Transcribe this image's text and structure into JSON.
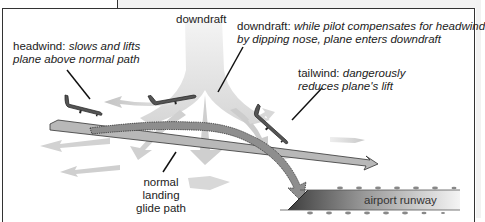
{
  "diagram": {
    "title_labels": {
      "downdraft_top": "downdraft"
    },
    "callouts": [
      {
        "id": "headwind",
        "term": "headwind:",
        "desc_line1": "slows and lifts",
        "desc_line2": "plane above normal path"
      },
      {
        "id": "downdraft",
        "term": "downdraft:",
        "desc_line1": "while pilot compensates for headwind",
        "desc_line2": "by dipping nose, plane enters downdraft"
      },
      {
        "id": "tailwind",
        "term": "tailwind:",
        "desc_line1": "dangerously",
        "desc_line2": "reduces plane's lift"
      }
    ],
    "glide_path_label": [
      "normal",
      "landing",
      "glide path"
    ],
    "runway_label": "airport runway",
    "colors": {
      "plane": "#5a5a5a",
      "glide_path": "#b4b4b4",
      "actual_path": "#8a8a8a",
      "wind": "#d0d0d0",
      "runway_dark": "#4a4a4a",
      "runway_light": "#e8e8e8"
    }
  }
}
